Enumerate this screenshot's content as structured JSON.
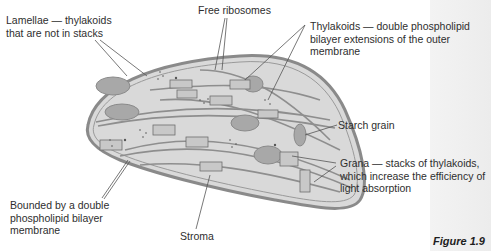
{
  "figure": {
    "caption": "Figure 1.9"
  },
  "labels": {
    "lamellae": [
      "Lamellae — thylakoids",
      "that are not in stacks"
    ],
    "free_ribosomes": [
      "Free ribosomes"
    ],
    "thylakoids": [
      "Thylakoids — double phospholipid",
      "bilayer extensions of the outer",
      "membrane"
    ],
    "starch_grain": [
      "Starch grain"
    ],
    "grana": [
      "Grana — stacks of thylakoids,",
      "which increase the efficiency of",
      "light absorption"
    ],
    "bounded": [
      "Bounded by a double",
      "phospholipid bilayer",
      "membrane"
    ],
    "stroma": [
      "Stroma"
    ]
  },
  "colors": {
    "membrane": "#8c8c8c",
    "stroma_fill": "#d6d6d6",
    "starch_fill": "#a9a9a9",
    "grana_lines": "#6e6e6e",
    "side_strip": "#efefef"
  }
}
